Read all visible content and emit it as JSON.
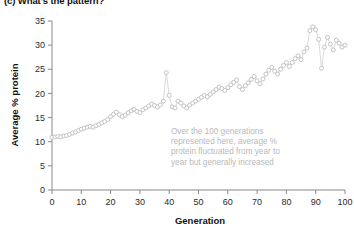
{
  "panel": {
    "title": "(c) What's the pattern?"
  },
  "annotation": {
    "lines": [
      "Over the 100 generations",
      "represented here, average %",
      "protein fluctuated from year to",
      "year but generally increased"
    ],
    "color": "#b9b9b9"
  },
  "colors": {
    "marker_fill": "#ffffff",
    "marker_stroke": "#bdbdbd",
    "line": "#cfcfcf",
    "axis": "#8a8a8a",
    "text": "#1a1a1a",
    "background": "#ffffff"
  },
  "chart_data": {
    "type": "line",
    "title": "(c) What's the pattern?",
    "xlabel": "Generation",
    "ylabel": "Average % protein",
    "xlim": [
      0,
      100
    ],
    "ylim": [
      0,
      35
    ],
    "xticks": [
      0,
      10,
      20,
      30,
      40,
      50,
      60,
      70,
      80,
      90,
      100
    ],
    "yticks": [
      0,
      5,
      10,
      15,
      20,
      25,
      30,
      35
    ],
    "grid": false,
    "legend": "none",
    "marker": "open-circle",
    "series": [
      {
        "name": "Average % protein",
        "x": [
          0,
          1,
          2,
          3,
          4,
          5,
          6,
          7,
          8,
          9,
          10,
          11,
          12,
          13,
          14,
          15,
          16,
          17,
          18,
          19,
          20,
          21,
          22,
          23,
          24,
          25,
          26,
          27,
          28,
          29,
          30,
          31,
          32,
          33,
          34,
          35,
          36,
          37,
          38,
          39,
          40,
          41,
          42,
          43,
          44,
          45,
          46,
          47,
          48,
          49,
          50,
          51,
          52,
          53,
          54,
          55,
          56,
          57,
          58,
          59,
          60,
          61,
          62,
          63,
          64,
          65,
          66,
          67,
          68,
          69,
          70,
          71,
          72,
          73,
          74,
          75,
          76,
          77,
          78,
          79,
          80,
          81,
          82,
          83,
          84,
          85,
          86,
          87,
          88,
          89,
          90,
          91,
          92,
          93,
          94,
          95,
          96,
          97,
          98,
          99,
          100
        ],
        "values": [
          10.9,
          11.0,
          11.1,
          11.0,
          11.2,
          11.3,
          11.5,
          11.8,
          12.0,
          12.3,
          12.6,
          12.8,
          13.0,
          13.2,
          13.0,
          13.3,
          13.6,
          13.9,
          14.2,
          14.6,
          15.2,
          15.7,
          16.1,
          15.6,
          15.2,
          15.5,
          16.0,
          16.4,
          16.7,
          16.3,
          16.0,
          16.6,
          17.0,
          17.4,
          17.8,
          17.5,
          17.2,
          17.6,
          18.4,
          24.3,
          19.6,
          17.2,
          17.0,
          18.4,
          18.0,
          17.4,
          17.0,
          17.6,
          18.0,
          18.4,
          18.8,
          19.2,
          19.6,
          19.3,
          19.8,
          20.3,
          20.8,
          21.3,
          21.0,
          20.6,
          21.2,
          21.8,
          22.3,
          22.8,
          21.4,
          20.8,
          21.6,
          22.2,
          22.9,
          23.5,
          22.6,
          22.0,
          23.0,
          24.0,
          24.8,
          25.4,
          24.6,
          24.0,
          25.0,
          25.8,
          26.4,
          25.6,
          26.4,
          27.2,
          27.8,
          27.0,
          28.6,
          29.4,
          33.0,
          33.8,
          33.2,
          31.2,
          25.2,
          29.6,
          31.6,
          30.2,
          29.0,
          31.0,
          30.4,
          29.6,
          30.0
        ]
      }
    ]
  },
  "axes": {
    "x": {
      "label": "Generation",
      "ticks": [
        "0",
        "10",
        "20",
        "30",
        "40",
        "50",
        "60",
        "70",
        "80",
        "90",
        "100"
      ]
    },
    "y": {
      "label": "Average % protein",
      "ticks": [
        "0",
        "5",
        "10",
        "15",
        "20",
        "25",
        "30",
        "35"
      ]
    }
  }
}
